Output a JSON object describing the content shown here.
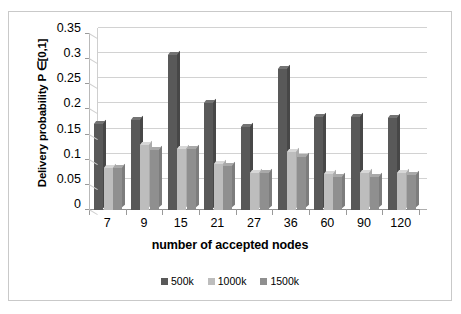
{
  "chart_data": {
    "type": "bar",
    "title": "",
    "xlabel": "number of accepted nodes",
    "ylabel": "Delivery probability P ∈[0,1]",
    "categories": [
      "7",
      "9",
      "15",
      "21",
      "27",
      "36",
      "60",
      "90",
      "120"
    ],
    "series": [
      {
        "name": "500k",
        "color": "#595959",
        "values": [
          0.172,
          0.18,
          0.308,
          0.212,
          0.165,
          0.28,
          0.185,
          0.185,
          0.182
        ]
      },
      {
        "name": "1000k",
        "color": "#bdbdbd",
        "values": [
          0.083,
          0.128,
          0.12,
          0.09,
          0.073,
          0.115,
          0.07,
          0.072,
          0.073
        ]
      },
      {
        "name": "1500k",
        "color": "#8f8f8f",
        "values": [
          0.082,
          0.118,
          0.12,
          0.085,
          0.073,
          0.103,
          0.065,
          0.064,
          0.068
        ]
      }
    ],
    "ylim": [
      0,
      0.35
    ],
    "yticks": [
      "0",
      "0.05",
      "0.1",
      "0.15",
      "0.2",
      "0.25",
      "0.3",
      "0.35"
    ],
    "ytick_values": [
      0,
      0.05,
      0.1,
      0.15,
      0.2,
      0.25,
      0.3,
      0.35
    ],
    "grid": true,
    "legend_position": "bottom",
    "style": "excel-3d-clustered-column",
    "frame_color": "#c9c9c9",
    "gridline_color": "#d2d2d2",
    "background": "#ffffff"
  }
}
